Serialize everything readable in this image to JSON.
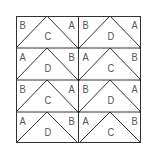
{
  "diagram": {
    "title": "",
    "columns": 2,
    "rows": 4,
    "tiles": [
      {
        "row": 0,
        "col": 0,
        "left": "B",
        "center": "C",
        "right": "A"
      },
      {
        "row": 0,
        "col": 1,
        "left": "B",
        "center": "D",
        "right": "A"
      },
      {
        "row": 1,
        "col": 0,
        "left": "A",
        "center": "D",
        "right": "B"
      },
      {
        "row": 1,
        "col": 1,
        "left": "A",
        "center": "C",
        "right": "B"
      },
      {
        "row": 2,
        "col": 0,
        "left": "B",
        "center": "C",
        "right": "A"
      },
      {
        "row": 2,
        "col": 1,
        "left": "B",
        "center": "D",
        "right": "A"
      },
      {
        "row": 3,
        "col": 0,
        "left": "A",
        "center": "D",
        "right": "B"
      },
      {
        "row": 3,
        "col": 1,
        "left": "A",
        "center": "C",
        "right": "B"
      }
    ],
    "colors": {
      "line": "#333333",
      "text": "#555555",
      "background": "#ffffff"
    }
  }
}
